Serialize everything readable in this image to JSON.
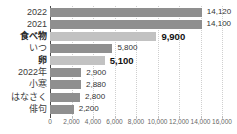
{
  "chart_data": {
    "type": "bar",
    "orientation": "horizontal",
    "title": "",
    "xlabel": "",
    "ylabel": "",
    "categories": [
      "2022",
      "2021",
      "食べ物",
      "いつ",
      "卵",
      "2022年",
      "小寒",
      "はなさく",
      "俳句"
    ],
    "values": [
      14120,
      14100,
      9900,
      5800,
      5100,
      2900,
      2880,
      2800,
      2200
    ],
    "value_labels": [
      "14,120",
      "14,100",
      "9,900",
      "5,800",
      "5,100",
      "2,900",
      "2,880",
      "2,800",
      "2,200"
    ],
    "highlighted_indices": [
      2,
      4
    ],
    "xlim": [
      0,
      16000
    ],
    "x_ticks": [
      0,
      2000,
      4000,
      6000,
      8000,
      10000,
      12000,
      14000,
      16000
    ],
    "x_tick_labels": [
      "0",
      "2,000",
      "4,000",
      "6,000",
      "8,000",
      "10,000",
      "12,000",
      "14,000",
      "16,000"
    ],
    "grid": "vertical-dotted",
    "legend": "none",
    "colors": {
      "bar": "#8f8f8f",
      "bar_highlighted": "#c2c2c2",
      "axis_line": "#4a4a4a",
      "gridline": "#cfcfcf",
      "label_text": "#3c3c3c",
      "value_text": "#333333",
      "tick_text": "#666666",
      "background": "#ffffff"
    }
  }
}
